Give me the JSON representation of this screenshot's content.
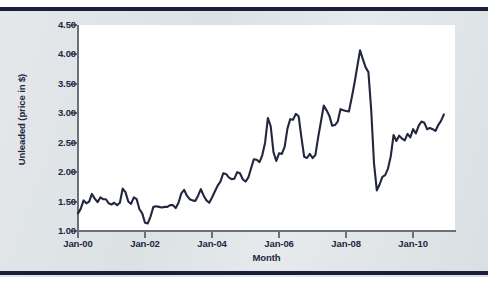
{
  "chart_data": {
    "type": "line",
    "title": "",
    "xlabel": "Month",
    "ylabel": "Unleaded (price in $)",
    "xlim": [
      "Jan-00",
      "Jul-11"
    ],
    "ylim": [
      1.0,
      4.5
    ],
    "ytick_step": 0.5,
    "grid": false,
    "legend": null,
    "line_color": "#23263f",
    "plot_background": "#ffffff",
    "panel_background": "#dfe3e6",
    "rule_color": "#1c1f3b",
    "axis_color": "#6a7078",
    "ytick_labels": [
      "1.00",
      "1.50",
      "2.00",
      "2.50",
      "3.00",
      "3.50",
      "4.00",
      "4.50"
    ],
    "ytick_values": [
      1.0,
      1.5,
      2.0,
      2.5,
      3.0,
      3.5,
      4.0,
      4.5
    ],
    "xtick_labels": [
      "Jan-00",
      "Jan-02",
      "Jan-04",
      "Jan-06",
      "Jan-08",
      "Jan-10"
    ],
    "xtick_values": [
      0,
      24,
      48,
      72,
      96,
      120
    ],
    "series": [
      {
        "name": "Unleaded",
        "x_start": "Jan-00",
        "x_interval": "month",
        "values": [
          1.3,
          1.38,
          1.52,
          1.47,
          1.5,
          1.63,
          1.55,
          1.49,
          1.57,
          1.54,
          1.54,
          1.47,
          1.45,
          1.48,
          1.44,
          1.48,
          1.72,
          1.66,
          1.5,
          1.46,
          1.57,
          1.54,
          1.37,
          1.3,
          1.14,
          1.13,
          1.25,
          1.41,
          1.42,
          1.41,
          1.4,
          1.41,
          1.41,
          1.44,
          1.44,
          1.39,
          1.48,
          1.64,
          1.7,
          1.6,
          1.54,
          1.52,
          1.51,
          1.6,
          1.71,
          1.6,
          1.52,
          1.48,
          1.57,
          1.67,
          1.77,
          1.84,
          1.98,
          1.97,
          1.91,
          1.88,
          1.89,
          2.0,
          1.98,
          1.88,
          1.84,
          1.91,
          2.07,
          2.22,
          2.21,
          2.17,
          2.29,
          2.5,
          2.92,
          2.78,
          2.34,
          2.19,
          2.32,
          2.31,
          2.43,
          2.74,
          2.9,
          2.89,
          2.99,
          2.95,
          2.59,
          2.26,
          2.24,
          2.31,
          2.24,
          2.29,
          2.59,
          2.86,
          3.13,
          3.05,
          2.96,
          2.79,
          2.8,
          2.86,
          3.07,
          3.05,
          3.04,
          3.03,
          3.26,
          3.51,
          3.79,
          4.07,
          3.92,
          3.78,
          3.7,
          3.05,
          2.15,
          1.69,
          1.79,
          1.92,
          1.95,
          2.06,
          2.27,
          2.63,
          2.53,
          2.62,
          2.57,
          2.54,
          2.65,
          2.59,
          2.73,
          2.66,
          2.79,
          2.86,
          2.84,
          2.73,
          2.75,
          2.73,
          2.7,
          2.8,
          2.87,
          2.98
        ]
      }
    ]
  },
  "axis": {
    "y_title": "Unleaded (price in $)",
    "x_title": "Month"
  }
}
